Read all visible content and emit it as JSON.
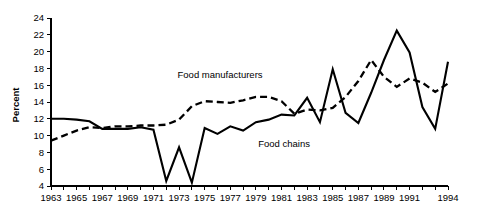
{
  "chart_data": {
    "type": "line",
    "title": "",
    "xlabel": "",
    "ylabel": "Percent",
    "ylim": [
      4,
      24
    ],
    "xlim": [
      1963,
      1994
    ],
    "yticks": [
      4,
      6,
      8,
      10,
      12,
      14,
      16,
      18,
      20,
      22,
      24
    ],
    "xticks": [
      1963,
      1964,
      1965,
      1966,
      1967,
      1968,
      1969,
      1970,
      1971,
      1972,
      1973,
      1974,
      1975,
      1976,
      1977,
      1978,
      1979,
      1980,
      1981,
      1982,
      1983,
      1984,
      1985,
      1986,
      1987,
      1988,
      1989,
      1990,
      1991,
      1992,
      1993,
      1994
    ],
    "xtick_labels": [
      "1963",
      "",
      "1965",
      "",
      "1967",
      "",
      "1969",
      "",
      "1971",
      "",
      "1973",
      "",
      "1975",
      "",
      "1977",
      "",
      "1979",
      "",
      "1981",
      "",
      "1983",
      "",
      "1985",
      "",
      "1987",
      "",
      "1989",
      "",
      "1991",
      "",
      "",
      "1994"
    ],
    "grid": false,
    "legend_position": "inline-annotation",
    "x": [
      1963,
      1964,
      1965,
      1966,
      1967,
      1968,
      1969,
      1970,
      1971,
      1972,
      1973,
      1974,
      1975,
      1976,
      1977,
      1978,
      1979,
      1980,
      1981,
      1982,
      1983,
      1984,
      1985,
      1986,
      1987,
      1988,
      1989,
      1990,
      1991,
      1992,
      1993,
      1994
    ],
    "series": [
      {
        "name": "Food chains",
        "style": "solid",
        "label": "Food chains",
        "values": [
          12.0,
          12.0,
          11.9,
          11.7,
          10.8,
          10.8,
          10.8,
          11.0,
          10.7,
          4.6,
          8.6,
          4.4,
          10.9,
          10.2,
          11.1,
          10.6,
          11.6,
          11.9,
          12.5,
          12.4,
          14.5,
          11.6,
          17.9,
          12.7,
          11.5,
          15.1,
          19.0,
          22.5,
          19.9,
          13.4,
          10.8,
          18.8
        ]
      },
      {
        "name": "Food manufacturers",
        "style": "dashed",
        "label": "Food manufacturers",
        "values": [
          9.4,
          10.0,
          10.6,
          11.0,
          10.9,
          11.1,
          11.1,
          11.2,
          11.2,
          11.3,
          11.9,
          13.5,
          14.1,
          14.0,
          13.9,
          14.2,
          14.6,
          14.6,
          14.1,
          12.6,
          13.1,
          13.0,
          13.3,
          14.6,
          16.5,
          19.0,
          17.0,
          15.8,
          16.8,
          16.3,
          15.2,
          16.2
        ]
      }
    ],
    "annotations": [
      {
        "text": "Food manufacturers",
        "x": 1976.2,
        "y": 16.9
      },
      {
        "text": "Food chains",
        "x": 1981.2,
        "y": 8.6
      }
    ]
  }
}
